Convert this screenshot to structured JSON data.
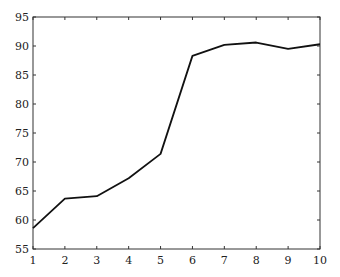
{
  "chart_data": {
    "type": "line",
    "title": "",
    "xlabel": "",
    "ylabel": "",
    "x": [
      1,
      2,
      3,
      4,
      5,
      6,
      7,
      8,
      9,
      10
    ],
    "series": [
      {
        "name": "series-1",
        "values": [
          58.6,
          63.7,
          64.1,
          67.2,
          71.4,
          88.3,
          90.2,
          90.6,
          89.5,
          90.3
        ],
        "color": "#111111"
      }
    ],
    "xlim": [
      1,
      10
    ],
    "ylim": [
      55,
      95
    ],
    "xticks": [
      1,
      2,
      3,
      4,
      5,
      6,
      7,
      8,
      9,
      10
    ],
    "yticks": [
      55,
      60,
      65,
      70,
      75,
      80,
      85,
      90,
      95
    ],
    "grid": false,
    "legend": null
  },
  "layout": {
    "plot_left": 33,
    "plot_right": 320,
    "plot_top": 17,
    "plot_bottom": 249
  }
}
